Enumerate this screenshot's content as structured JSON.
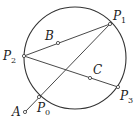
{
  "diagram": {
    "stroke": "#333333",
    "circle": {
      "cx": 75,
      "cy": 58,
      "r": 51
    },
    "points": {
      "P0": {
        "x": 39,
        "y": 97,
        "label": "P",
        "sub": "0",
        "lx": 37,
        "ly": 112
      },
      "P1": {
        "x": 110,
        "y": 24,
        "label": "P",
        "sub": "1",
        "lx": 113,
        "ly": 20
      },
      "P2": {
        "x": 24,
        "y": 56,
        "label": "P",
        "sub": "2",
        "lx": 3,
        "ly": 60
      },
      "P3": {
        "x": 118,
        "y": 87,
        "label": "P",
        "sub": "3",
        "lx": 120,
        "ly": 100
      },
      "A": {
        "x": 25,
        "y": 112,
        "label": "A",
        "sub": "",
        "lx": 12,
        "ly": 116
      },
      "B": {
        "x": 58,
        "y": 43,
        "label": "B",
        "sub": "",
        "lx": 45,
        "ly": 40
      },
      "C": {
        "x": 90,
        "y": 78,
        "label": "C",
        "sub": "",
        "lx": 93,
        "ly": 74
      }
    },
    "segments": [
      [
        "A",
        "P1"
      ],
      [
        "P2",
        "P1"
      ],
      [
        "P2",
        "P3"
      ]
    ]
  }
}
